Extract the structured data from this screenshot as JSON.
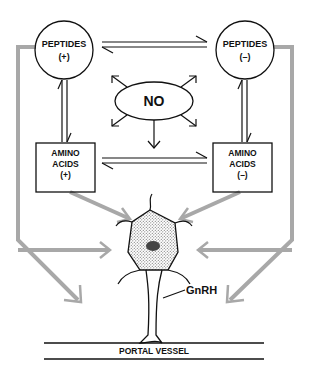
{
  "diagram": {
    "nodes": {
      "peptides_plus": {
        "line1": "PEPTIDES",
        "line2": "(+)"
      },
      "peptides_minus": {
        "line1": "PEPTIDES",
        "line2": "(–)"
      },
      "no": {
        "label": "NO"
      },
      "amino_plus": {
        "line1": "AMINO",
        "line2": "ACIDS",
        "line3": "(+)"
      },
      "amino_minus": {
        "line1": "AMINO",
        "line2": "ACIDS",
        "line3": "(–)"
      },
      "neuron_output": {
        "label": "GnRH"
      },
      "portal_vessel": {
        "label": "PORTAL VESSEL"
      }
    },
    "edges": [
      {
        "from": "peptides_plus",
        "to": "peptides_minus",
        "type": "equilibrium"
      },
      {
        "from": "amino_plus",
        "to": "amino_minus",
        "type": "equilibrium"
      },
      {
        "from": "peptides_plus",
        "to": "amino_plus",
        "type": "equilibrium"
      },
      {
        "from": "peptides_minus",
        "to": "amino_minus",
        "type": "equilibrium"
      },
      {
        "from": "no",
        "to": "all",
        "type": "radiating"
      },
      {
        "from": "amino_plus",
        "to": "neuron",
        "type": "gray-arrow"
      },
      {
        "from": "amino_minus",
        "to": "neuron",
        "type": "gray-arrow"
      },
      {
        "from": "peptides_plus",
        "to": "neuron",
        "type": "gray-arrow"
      },
      {
        "from": "peptides_minus",
        "to": "neuron",
        "type": "gray-arrow"
      },
      {
        "from": "peptides_plus",
        "to": "portal_vessel",
        "type": "gray-arrow"
      },
      {
        "from": "peptides_minus",
        "to": "portal_vessel",
        "type": "gray-arrow"
      }
    ],
    "colors": {
      "ink": "#111111",
      "gray_arrow": "#a8a8a8",
      "stipple": "#888888",
      "nucleus": "#444444"
    }
  }
}
